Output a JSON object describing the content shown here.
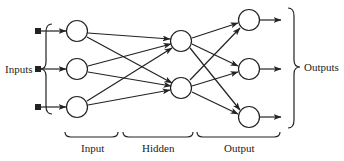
{
  "diagram": {
    "type": "neural-network",
    "labels": {
      "inputs": "Inputs",
      "outputs": "Outputs",
      "input_layer": "Input",
      "hidden_layer": "Hidden",
      "output_layer": "Output"
    },
    "layers": [
      {
        "name": "Input",
        "nodes": 3
      },
      {
        "name": "Hidden",
        "nodes": 2
      },
      {
        "name": "Output",
        "nodes": 3
      }
    ],
    "colors": {
      "stroke": "#222222",
      "background": "#ffffff"
    }
  }
}
